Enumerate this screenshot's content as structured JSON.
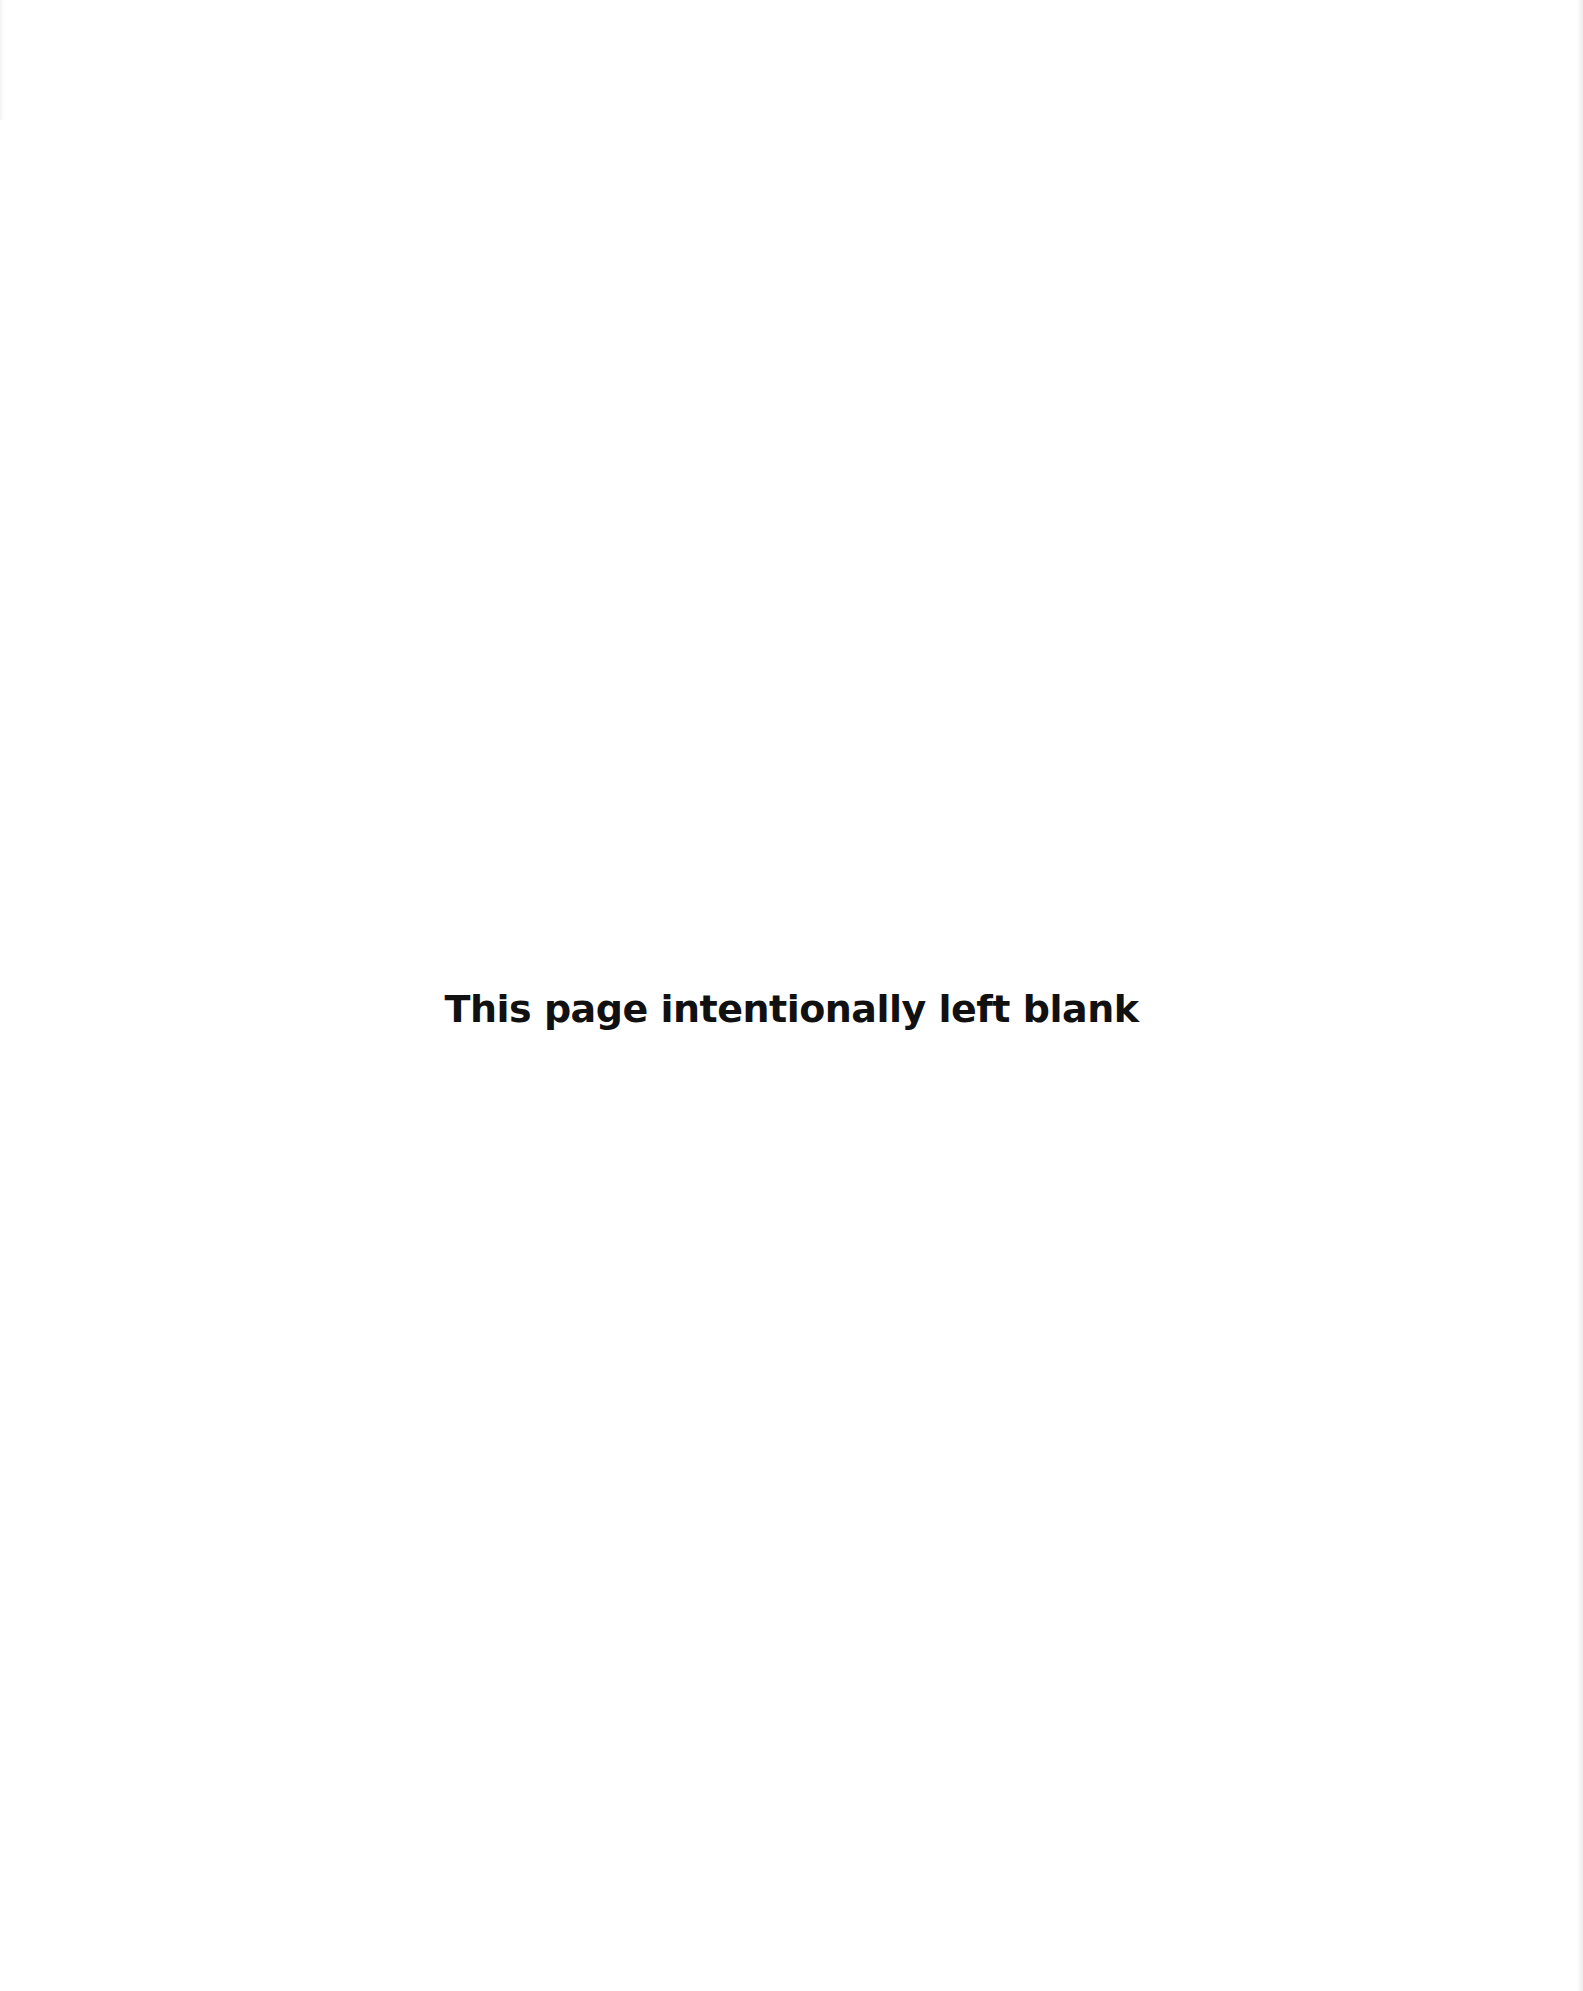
{
  "page": {
    "notice_text": "This page intentionally left blank",
    "background_color": "#ffffff",
    "text_color": "#111111"
  }
}
